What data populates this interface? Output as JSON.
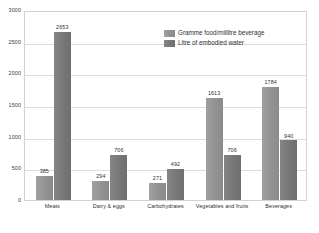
{
  "chart_data": {
    "type": "bar",
    "title": "",
    "xlabel": "",
    "ylabel": "",
    "ylim": [
      0,
      3000
    ],
    "ytick_step": 500,
    "yticks": [
      "0",
      "500",
      "1000",
      "1500",
      "2000",
      "2500",
      "3000"
    ],
    "grid": true,
    "legend_position": "inside-top-center",
    "categories": [
      "Meats",
      "Dairy & eggs",
      "Carbohydrates",
      "Vegetables and fruits",
      "Beverages"
    ],
    "series": [
      {
        "name": "Gramme food/millitre beverage",
        "color": "#929292",
        "values": [
          385,
          294,
          271,
          1613,
          1784
        ]
      },
      {
        "name": "Litre of embodied water",
        "color": "#777777",
        "values": [
          2653,
          706,
          492,
          706,
          940
        ]
      }
    ]
  },
  "legend": {
    "items": [
      {
        "label": "Gramme food/millitre beverage"
      },
      {
        "label": "Litre of embodied water"
      }
    ]
  }
}
